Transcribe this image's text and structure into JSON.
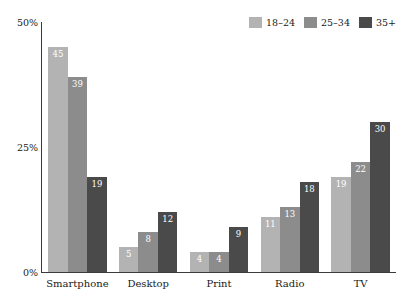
{
  "chart_data": {
    "type": "bar",
    "title": "",
    "xlabel": "",
    "ylabel": "",
    "ylim": [
      0,
      50
    ],
    "y_ticks": [
      "0%",
      "25%",
      "50%"
    ],
    "grid": false,
    "legend_position": "top-right",
    "categories": [
      "Smartphone",
      "Desktop",
      "Print",
      "Radio",
      "TV"
    ],
    "series": [
      {
        "name": "18–24",
        "color": "#b3b3b3",
        "values": [
          45,
          5,
          4,
          11,
          19
        ]
      },
      {
        "name": "25–34",
        "color": "#8c8c8c",
        "values": [
          39,
          8,
          4,
          13,
          22
        ]
      },
      {
        "name": "35+",
        "color": "#4a4a4a",
        "values": [
          19,
          12,
          9,
          18,
          30
        ]
      }
    ]
  },
  "axis": {
    "y_tick_top": "50%",
    "y_tick_mid": "25%",
    "y_tick_bottom": "0%"
  },
  "legend": {
    "items": [
      {
        "label": "18–24",
        "color": "#b3b3b3"
      },
      {
        "label": "25–34",
        "color": "#8c8c8c"
      },
      {
        "label": "35+",
        "color": "#4a4a4a"
      }
    ]
  },
  "title_partial": " "
}
